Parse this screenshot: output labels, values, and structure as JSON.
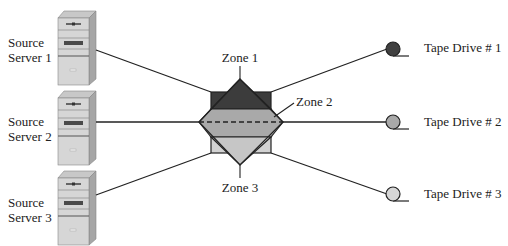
{
  "diagram": {
    "type": "SAN zoning diagram",
    "servers": [
      {
        "line1": "Source",
        "line2": "Server 1",
        "top": 11
      },
      {
        "line1": "Source",
        "line2": "Server 2",
        "top": 91
      },
      {
        "line1": "Source",
        "line2": "Server 3",
        "top": 171
      }
    ],
    "zones": [
      {
        "label": "Zone 1",
        "color": "#3c3c3c"
      },
      {
        "label": "Zone 2",
        "color": "#a9a9a9"
      },
      {
        "label": "Zone 3",
        "color": "#d2d2d2"
      }
    ],
    "tape_drives": [
      {
        "label": "Tape Drive # 1",
        "color": "#404040"
      },
      {
        "label": "Tape Drive # 2",
        "color": "#a9a9a9"
      },
      {
        "label": "Tape Drive # 3",
        "color": "#d6d6d6"
      }
    ],
    "colors": {
      "line": "#222222",
      "server_face": "#d4d4d4",
      "server_side": "#a8a8a8",
      "server_top": "#c4c4c4"
    }
  }
}
